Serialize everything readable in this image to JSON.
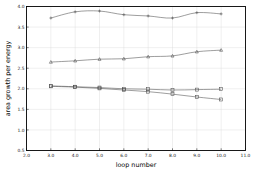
{
  "chart_data": {
    "type": "line",
    "title": "",
    "xlabel": "loop number",
    "ylabel": "area growth per energy",
    "xlim": [
      2.0,
      11.0
    ],
    "ylim": [
      0.5,
      4.0
    ],
    "grid": true,
    "legend": "none",
    "xticks": [
      "2.0",
      "3.0",
      "4.0",
      "5.0",
      "6.0",
      "7.0",
      "8.0",
      "9.0",
      "10.0",
      "11.0"
    ],
    "xtick_values": [
      2.0,
      3.0,
      4.0,
      5.0,
      6.0,
      7.0,
      8.0,
      9.0,
      10.0,
      11.0
    ],
    "yticks": [
      "0.5",
      "1.0",
      "1.5",
      "2.0",
      "2.5",
      "3.0",
      "3.5",
      "4.0"
    ],
    "ytick_values": [
      0.5,
      1.0,
      1.5,
      2.0,
      2.5,
      3.0,
      3.5,
      4.0
    ],
    "x": [
      3,
      4,
      5,
      6,
      7,
      8,
      9,
      10
    ],
    "series": [
      {
        "name": "series-1",
        "marker": "plus",
        "color": "#4d4d4d",
        "values": [
          3.72,
          3.87,
          3.89,
          3.8,
          3.77,
          3.72,
          3.85,
          3.82
        ]
      },
      {
        "name": "series-2",
        "marker": "triangle",
        "color": "#4d4d4d",
        "values": [
          2.65,
          2.68,
          2.72,
          2.73,
          2.78,
          2.8,
          2.9,
          2.94
        ]
      },
      {
        "name": "series-3",
        "marker": "square",
        "color": "#4d4d4d",
        "values": [
          2.07,
          2.05,
          2.03,
          2.0,
          1.99,
          1.97,
          1.98,
          1.99
        ]
      },
      {
        "name": "series-4",
        "marker": "square",
        "color": "#4d4d4d",
        "values": [
          2.06,
          2.04,
          2.01,
          1.97,
          1.93,
          1.87,
          1.8,
          1.74
        ]
      }
    ]
  }
}
